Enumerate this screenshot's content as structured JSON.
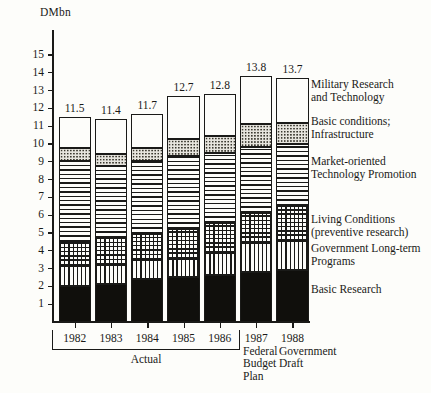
{
  "chart_data": {
    "type": "bar",
    "subtype": "stacked",
    "title": "",
    "ylabel": "DMbn",
    "xlabel": "",
    "ylim": [
      0,
      15.6
    ],
    "yticks": [
      1,
      2,
      3,
      4,
      5,
      6,
      7,
      8,
      9,
      10,
      11,
      12,
      13,
      14,
      15
    ],
    "ytick_labels": [
      "1",
      "2",
      "3",
      "4",
      "5",
      "6",
      "7",
      "8",
      "9",
      "10",
      "11",
      "12",
      "13",
      "14",
      "15"
    ],
    "grid": false,
    "legend_position": "right",
    "categories": [
      "1982",
      "1983",
      "1984",
      "1985",
      "1986",
      "1987",
      "1988"
    ],
    "totals": [
      11.5,
      11.4,
      11.7,
      12.7,
      12.8,
      13.8,
      13.7
    ],
    "total_labels": [
      "11.5",
      "11.4",
      "11.7",
      "12.7",
      "12.8",
      "13.8",
      "13.7"
    ],
    "series": [
      {
        "name": "Basic Research",
        "pattern": "solid-black",
        "values": [
          2.0,
          2.15,
          2.4,
          2.55,
          2.65,
          2.8,
          2.95
        ]
      },
      {
        "name": "Government Long-term Programs",
        "pattern": "vertical-lines",
        "values": [
          1.15,
          1.05,
          1.1,
          1.0,
          1.2,
          1.65,
          1.6
        ]
      },
      {
        "name": "Living Conditions (preventive research)",
        "pattern": "cross-hatch-grid",
        "values": [
          1.35,
          1.5,
          1.45,
          1.7,
          1.7,
          1.7,
          1.95
        ]
      },
      {
        "name": "Market-oriented Technology Promotion",
        "pattern": "horizontal-lines",
        "values": [
          4.55,
          4.05,
          4.1,
          4.05,
          3.95,
          3.7,
          3.5
        ]
      },
      {
        "name": "Basic conditions; Infrastructure",
        "pattern": "stipple-dots",
        "values": [
          0.75,
          0.7,
          0.7,
          1.0,
          0.95,
          1.25,
          1.2
        ]
      },
      {
        "name": "Military Research and Technology",
        "pattern": "blank-white",
        "values": [
          1.7,
          1.95,
          1.95,
          2.4,
          2.35,
          2.7,
          2.5
        ]
      }
    ],
    "cumulative_tops": [
      [
        2.0,
        3.15,
        4.5,
        9.05,
        9.8,
        11.5
      ],
      [
        2.15,
        3.2,
        4.7,
        8.75,
        9.45,
        11.4
      ],
      [
        2.4,
        3.5,
        4.95,
        9.05,
        9.75,
        11.7
      ],
      [
        2.55,
        3.55,
        5.25,
        9.3,
        10.3,
        12.7
      ],
      [
        2.65,
        3.85,
        5.55,
        9.5,
        10.45,
        12.8
      ],
      [
        2.8,
        4.45,
        6.15,
        9.85,
        11.1,
        13.8
      ],
      [
        2.95,
        4.55,
        6.5,
        10.0,
        11.2,
        13.7
      ]
    ],
    "annotations": [
      {
        "text": "Actual",
        "covers": [
          "1982",
          "1983",
          "1984",
          "1985",
          "1986"
        ]
      },
      {
        "text": "Federal Budget Plan",
        "covers": [
          "1987"
        ]
      },
      {
        "text": "Government Draft",
        "covers": [
          "1988"
        ]
      }
    ]
  },
  "legend": {
    "entries": [
      {
        "lines": [
          "Military Research",
          "and Technology"
        ]
      },
      {
        "lines": [
          "Basic conditions;",
          "Infrastructure"
        ]
      },
      {
        "lines": [
          "Market-oriented",
          "Technology Promotion"
        ]
      },
      {
        "lines": [
          "Living Conditions",
          "(preventive research)"
        ]
      },
      {
        "lines": [
          "Government Long-term",
          "Programs"
        ]
      },
      {
        "lines": [
          "Basic Research"
        ]
      }
    ]
  },
  "group_labels": {
    "actual": "Actual",
    "federal_budget_plan_lines": [
      "Federal",
      "Budget",
      "Plan"
    ],
    "government_draft_lines": [
      "Government",
      "Draft"
    ]
  },
  "colors": {
    "ink": "#1a1a18",
    "paper": "#fdfdfa",
    "solid_fill": "#100f0c",
    "stipple_fill": "#e7e5de"
  }
}
